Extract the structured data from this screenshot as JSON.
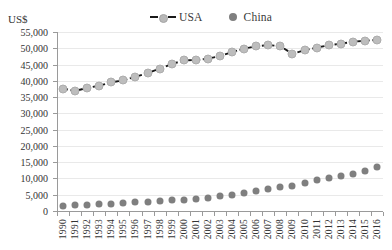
{
  "unit_label": "US$",
  "legend": {
    "position": "top-center",
    "items": [
      {
        "name": "USA",
        "marker": "line-dashed-with-circle",
        "color": "#1a1a1a"
      },
      {
        "name": "China",
        "marker": "circle",
        "color": "#7f7f7f"
      }
    ]
  },
  "chart_data": {
    "type": "line",
    "title": "",
    "subtitle": "",
    "xlabel": "",
    "ylabel": "US$",
    "ylim": [
      0,
      55000
    ],
    "ytick_labels": [
      "0",
      "5,000",
      "10,000",
      "15,000",
      "20,000",
      "25,000",
      "30,000",
      "35,000",
      "40,000",
      "45,000",
      "50,000",
      "55,000"
    ],
    "ytick_values": [
      0,
      5000,
      10000,
      15000,
      20000,
      25000,
      30000,
      35000,
      40000,
      45000,
      50000,
      55000
    ],
    "grid": true,
    "legend_position": "top-center",
    "categories": [
      "1990",
      "1991",
      "1992",
      "1993",
      "1994",
      "1995",
      "1996",
      "1997",
      "1998",
      "1999",
      "2000",
      "2001",
      "2002",
      "2003",
      "2004",
      "2005",
      "2006",
      "2007",
      "2008",
      "2009",
      "2010",
      "2011",
      "2012",
      "2013",
      "2014",
      "2015",
      "2016"
    ],
    "series": [
      {
        "name": "USA",
        "color": "#1a1a1a",
        "marker_color": "#bdbdbd",
        "line_style": "dashed",
        "values": [
          37600,
          36900,
          37800,
          38500,
          39500,
          40200,
          41200,
          42400,
          43700,
          45100,
          46300,
          46400,
          46800,
          47600,
          48800,
          49900,
          50600,
          51000,
          50600,
          48300,
          49400,
          50200,
          50900,
          51400,
          52000,
          52300,
          52600
        ]
      },
      {
        "name": "China",
        "color": "#7f7f7f",
        "marker_color": "#7f7f7f",
        "line_style": "none",
        "values": [
          1500,
          1700,
          1900,
          2100,
          2300,
          2500,
          2700,
          2900,
          3100,
          3300,
          3500,
          3800,
          4100,
          4500,
          4900,
          5400,
          6000,
          6700,
          7300,
          7800,
          8600,
          9400,
          10100,
          10800,
          11500,
          12300,
          13400
        ]
      }
    ]
  }
}
